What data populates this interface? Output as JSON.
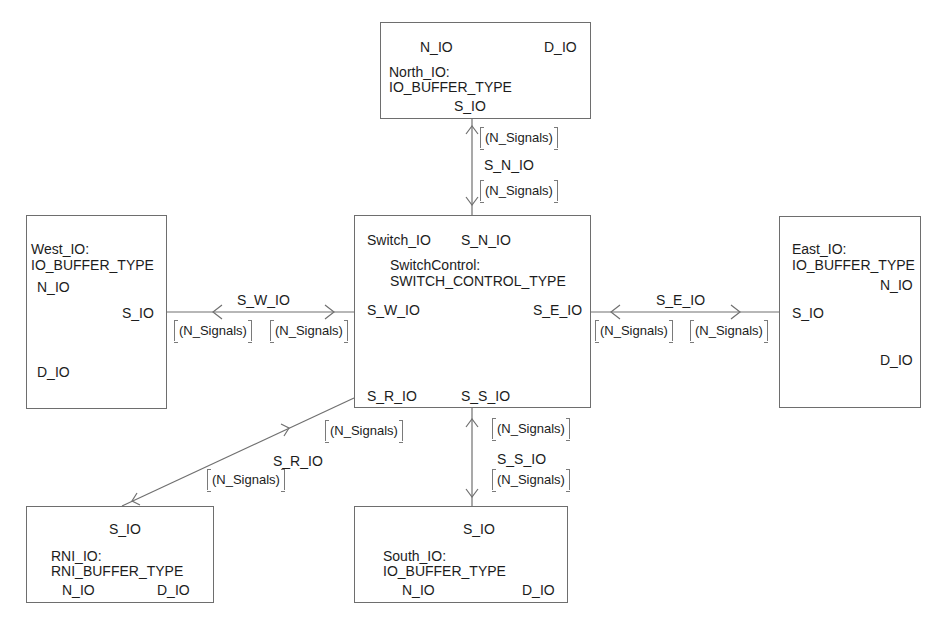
{
  "blocks": {
    "north": {
      "instance": "North_IO:",
      "type": "IO_BUFFER_TYPE",
      "ports": {
        "n": "N_IO",
        "d": "D_IO",
        "s": "S_IO"
      }
    },
    "west": {
      "instance": "West_IO:",
      "type": "IO_BUFFER_TYPE",
      "ports": {
        "n": "N_IO",
        "s": "S_IO",
        "d": "D_IO"
      }
    },
    "east": {
      "instance": "East_IO:",
      "type": "IO_BUFFER_TYPE",
      "ports": {
        "n": "N_IO",
        "s": "S_IO",
        "d": "D_IO"
      }
    },
    "south": {
      "instance": "South_IO:",
      "type": "IO_BUFFER_TYPE",
      "ports": {
        "s": "S_IO",
        "n": "N_IO",
        "d": "D_IO"
      }
    },
    "rni": {
      "instance": "RNI_IO:",
      "type": "RNI_BUFFER_TYPE",
      "ports": {
        "s": "S_IO",
        "n": "N_IO",
        "d": "D_IO"
      }
    },
    "switch": {
      "instance": "SwitchControl:",
      "type": "SWITCH_CONTROL_TYPE",
      "ports": {
        "switch_io": "Switch_IO",
        "s_n_io": "S_N_IO",
        "s_w_io": "S_W_IO",
        "s_e_io": "S_E_IO",
        "s_r_io": "S_R_IO",
        "s_s_io": "S_S_IO"
      }
    }
  },
  "connections": {
    "north": {
      "name": "S_N_IO",
      "sig_a": "(N_Signals)",
      "sig_b": "(N_Signals)"
    },
    "west": {
      "name": "S_W_IO",
      "sig_a": "(N_Signals)",
      "sig_b": "(N_Signals)"
    },
    "east": {
      "name": "S_E_IO",
      "sig_a": "(N_Signals)",
      "sig_b": "(N_Signals)"
    },
    "south": {
      "name": "S_S_IO",
      "sig_a": "(N_Signals)",
      "sig_b": "(N_Signals)"
    },
    "rni": {
      "name": "S_R_IO",
      "sig_a": "(N_Signals)",
      "sig_b": "(N_Signals)"
    }
  },
  "colors": {
    "line": "#6e6e6e",
    "text": "#1c1c1c",
    "background": "#ffffff"
  }
}
